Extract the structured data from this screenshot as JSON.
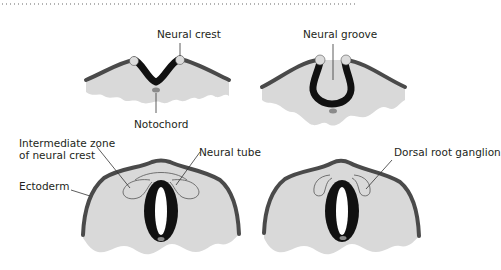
{
  "figure": {
    "panels": [
      {
        "id": "stage-1",
        "labels": {
          "neural_crest": "Neural crest",
          "notochord": "Notochord"
        }
      },
      {
        "id": "stage-2",
        "labels": {
          "neural_groove": "Neural groove"
        }
      },
      {
        "id": "stage-3",
        "labels": {
          "intermediate_zone_line1": "Intermediate zone",
          "intermediate_zone_line2": "of neural crest",
          "neural_tube": "Neural tube",
          "ectoderm": "Ectoderm"
        }
      },
      {
        "id": "stage-4",
        "labels": {
          "dorsal_root_ganglion": "Dorsal root ganglion"
        }
      }
    ],
    "colors": {
      "tissue": "#d9d9d9",
      "ectoderm": "#4a4a4a",
      "neural_tissue": "#111111",
      "notochord": "#8a8a8a"
    }
  }
}
